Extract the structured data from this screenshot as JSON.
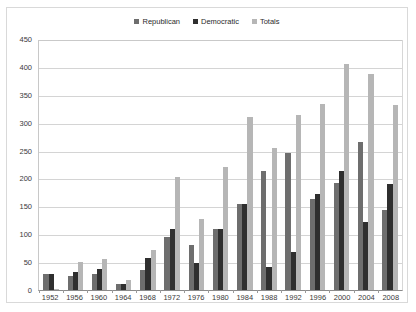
{
  "chart_data": {
    "type": "bar",
    "title": "",
    "subtitle": "",
    "xlabel": "",
    "ylabel": "",
    "ylim": [
      0,
      450
    ],
    "ytick_step": 50,
    "yticks": [
      450,
      400,
      350,
      300,
      250,
      200,
      150,
      100,
      50,
      0
    ],
    "grid": true,
    "legend_position": "top-center",
    "categories": [
      "1952",
      "1956",
      "1960",
      "1964",
      "1968",
      "1972",
      "1976",
      "1980",
      "1984",
      "1988",
      "1992",
      "1996",
      "2000",
      "2004",
      "2008"
    ],
    "series": [
      {
        "name": "Republican",
        "color": "#6e6e6e",
        "values": [
          28,
          25,
          28,
          10,
          35,
          95,
          80,
          110,
          155,
          213,
          245,
          163,
          192,
          265,
          143
        ]
      },
      {
        "name": "Democratic",
        "color": "#2f2f2f",
        "values": [
          28,
          32,
          38,
          10,
          58,
          110,
          48,
          110,
          155,
          42,
          68,
          172,
          213,
          122,
          190
        ]
      },
      {
        "name": "Totals",
        "color": "#b6b6b6",
        "values": [
          2,
          50,
          55,
          18,
          72,
          203,
          128,
          220,
          310,
          255,
          313,
          333,
          405,
          387,
          332
        ]
      }
    ]
  },
  "legend": {
    "items": [
      {
        "label": "Republican",
        "color": "#6e6e6e"
      },
      {
        "label": "Democratic",
        "color": "#2f2f2f"
      },
      {
        "label": "Totals",
        "color": "#b6b6b6"
      }
    ]
  }
}
